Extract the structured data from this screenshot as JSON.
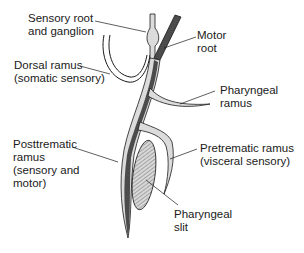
{
  "labels": {
    "sensory_root": "Sensory root\nand ganglion",
    "motor_root": "Motor\nroot",
    "dorsal_ramus": "Dorsal ramus\n(somatic sensory)",
    "pharyngeal_ramus": "Pharyngeal\nramus",
    "posttrematic_ramus": "Posttrematic\nramus\n(sensory and\nmotor)",
    "pretrematic_ramus": "Pretrematic ramus\n(visceral sensory)",
    "pharyngeal_slit": "Pharyngeal\nslit"
  },
  "colors": {
    "stroke": "#1a1a1a",
    "sensory_fill": "#e4e4e4",
    "motor_fill": "#555555",
    "slit_fill": "#cfcfcf",
    "text": "#1a1a1a"
  }
}
